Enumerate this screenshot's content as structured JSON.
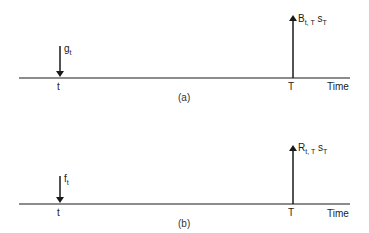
{
  "panels": [
    {
      "id": "a",
      "caption": "(a)",
      "axis_label": "Time",
      "tick_t": "t",
      "tick_T": "T",
      "down_arrow": {
        "main": "g",
        "sub": "t"
      },
      "up_arrow": {
        "main": "B",
        "sub": "t, T",
        "main2": "s",
        "sub2": "T"
      }
    },
    {
      "id": "b",
      "caption": "(b)",
      "axis_label": "Time",
      "tick_t": "t",
      "tick_T": "T",
      "down_arrow": {
        "main": "f",
        "sub": "t"
      },
      "up_arrow": {
        "main": "R",
        "sub": "t, T",
        "main2": "s",
        "sub2": "T"
      }
    }
  ],
  "colors": {
    "line": "#1a1a1a",
    "background": "#ffffff"
  }
}
